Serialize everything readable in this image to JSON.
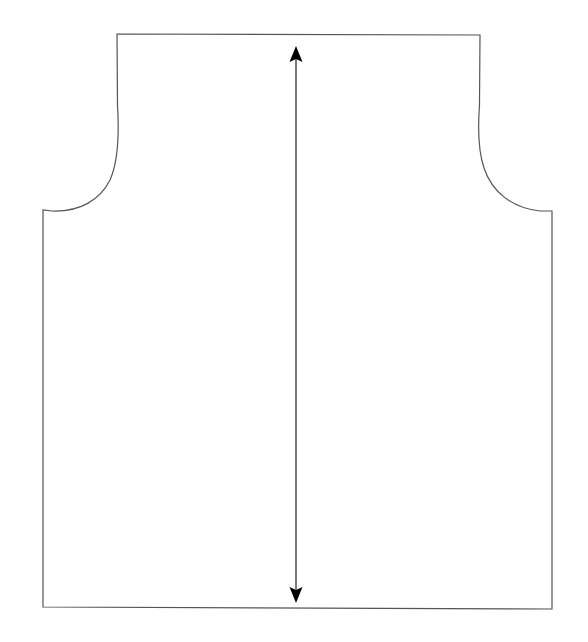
{
  "diagram": {
    "type": "sewing-pattern-piece",
    "colors": {
      "background": "#ffffff",
      "outline": "#555555",
      "grainline": "#333333",
      "arrowhead": "#000000"
    },
    "pattern_piece": {
      "name": "bodice-piece",
      "outline_width": 1.2
    },
    "grainline": {
      "name": "grainline-arrow",
      "direction": "vertical",
      "double_headed": true
    }
  }
}
